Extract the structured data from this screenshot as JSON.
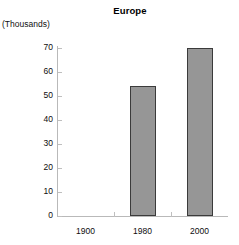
{
  "chart_data": {
    "type": "bar",
    "title": "Europe",
    "units_caption": "(Thousands)",
    "xlabel": "",
    "ylabel": "",
    "categories": [
      "1900",
      "1980",
      "2000"
    ],
    "values": [
      null,
      54,
      70
    ],
    "series": [
      {
        "name": "Europe",
        "values": [
          null,
          54,
          70
        ]
      }
    ],
    "ylim": [
      0,
      70
    ],
    "ytick_labels": [
      "0",
      "10",
      "20",
      "30",
      "40",
      "50",
      "60",
      "70"
    ],
    "ytick_values": [
      0,
      10,
      20,
      30,
      40,
      50,
      60,
      70
    ],
    "grid": false,
    "legend": "none",
    "bar_color": "#969696",
    "bar_border_color": "#3b3b3b",
    "axis_color": "#b9b9b9",
    "text_color": "#0d0d0d",
    "background": "#ffffff"
  }
}
